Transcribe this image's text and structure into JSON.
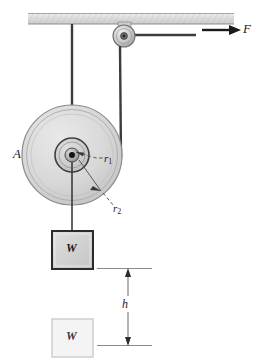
{
  "figure": {
    "type": "physics-free-body-diagram"
  },
  "labels": {
    "disk": "A",
    "force": "F",
    "height": "h",
    "inner_radius": "r",
    "inner_radius_sub": "1",
    "outer_radius": "r",
    "outer_radius_sub": "2",
    "weight_upper": "W",
    "weight_lower": "W"
  },
  "elements": {
    "ceiling": "hatched-support-icon",
    "small_pulley": "small-pulley-icon",
    "large_pulley": "compound-disk-icon",
    "hub": "axle-hub-icon",
    "force_arrow": "force-arrow-icon",
    "dimension_line": "height-dimension-icon",
    "rope_left": "rope-segment-icon",
    "rope_right": "rope-segment-icon",
    "rope_hanging": "rope-segment-icon",
    "block_upper": "weight-block-icon",
    "block_lower": "weight-block-ghost-icon",
    "leader_r1": "dashed-leader-icon",
    "leader_r2": "dashed-leader-icon"
  },
  "colors": {
    "ink": "#1a1a1a",
    "rope": "#3c3c3c",
    "ceiling_fill": "#dcdcdc",
    "ceiling_edge": "#9a9a9a",
    "disk_fill": "#d6d6d6",
    "disk_edge": "#8a8a8a",
    "disk_inner_fill": "#cfcfcf",
    "hub_fill": "#b8b8b8",
    "block_fill": "#d2d2d2",
    "block_edge": "#2b2b2b",
    "ghost_fill": "#f2f2f2",
    "ghost_edge": "#c8c8c8",
    "dim_line": "#6b6b6b"
  },
  "geometry": {
    "disk_center_x": 72,
    "disk_center_y": 155,
    "outer_radius_px": 50,
    "inner_radius_px": 17,
    "hub_radius_px": 7,
    "ceiling_y": 19,
    "small_pulley_x": 124,
    "small_pulley_y": 36,
    "height_top_y": 268,
    "height_bottom_y": 345
  }
}
